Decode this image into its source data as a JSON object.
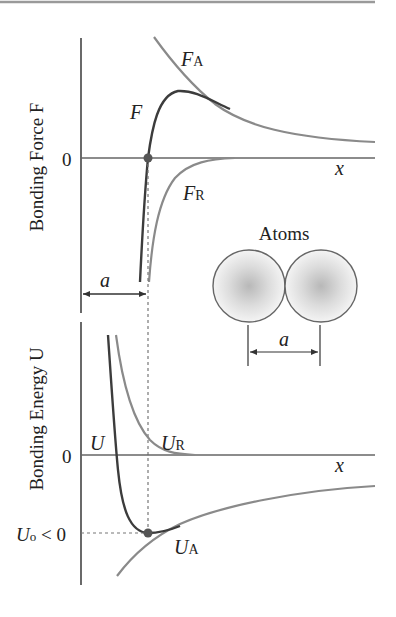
{
  "diagram": {
    "force_panel": {
      "ylabel": "Bonding Force F",
      "zero_label": "0",
      "x_label": "x",
      "curve_labels": {
        "F": "F",
        "FA_main": "F",
        "FA_sub": "A",
        "FR_main": "F",
        "FR_sub": "R"
      },
      "spacing_label": "a"
    },
    "energy_panel": {
      "ylabel": "Bonding Energy U",
      "zero_label": "0",
      "x_label": "x",
      "min_label_main": "U",
      "min_label_sub": "o",
      "min_label_rest": " < 0",
      "curve_labels": {
        "U": "U",
        "UR_main": "U",
        "UR_sub": "R",
        "UA_main": "U",
        "UA_sub": "A"
      }
    },
    "inset": {
      "title": "Atoms",
      "spacing_label": "a"
    },
    "colors": {
      "net_curve": "#3c3c3c",
      "component_curve": "#8a8a8a",
      "axis": "#555555",
      "rule": "#9a9a9a"
    }
  }
}
